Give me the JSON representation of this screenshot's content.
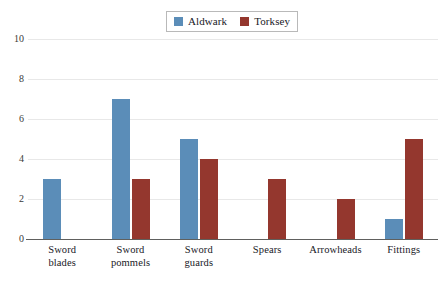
{
  "chart_data": {
    "type": "bar",
    "title": "",
    "xlabel": "",
    "ylabel": "",
    "ylim": [
      0,
      10
    ],
    "yticks": [
      0,
      2,
      4,
      6,
      8,
      10
    ],
    "grid": true,
    "legend_position": "top-center",
    "categories": [
      "Sword blades",
      "Sword pommels",
      "Sword guards",
      "Spears",
      "Arrowheads",
      "Fittings"
    ],
    "category_lines": [
      [
        "Sword",
        "blades"
      ],
      [
        "Sword",
        "pommels"
      ],
      [
        "Sword",
        "guards"
      ],
      [
        "Spears",
        ""
      ],
      [
        "Arrowheads",
        ""
      ],
      [
        "Fittings",
        ""
      ]
    ],
    "series": [
      {
        "name": "Aldwark",
        "color": "#5b8db8",
        "values": [
          3,
          7,
          5,
          0,
          0,
          1
        ]
      },
      {
        "name": "Torksey",
        "color": "#94372e",
        "values": [
          0,
          3,
          4,
          3,
          2,
          5
        ]
      }
    ]
  },
  "legend": {
    "entries": [
      {
        "label": "Aldwark",
        "color": "#5b8db8"
      },
      {
        "label": "Torksey",
        "color": "#94372e"
      }
    ]
  },
  "axes": {
    "y_tick_labels": [
      "10",
      "8",
      "6",
      "4",
      "2",
      "0"
    ]
  },
  "colors": {
    "aldwark": "#5b8db8",
    "torksey": "#94372e",
    "gridline": "#e8e8e8",
    "axis": "#60605e",
    "text": "#20201f",
    "background": "#ffffff"
  }
}
